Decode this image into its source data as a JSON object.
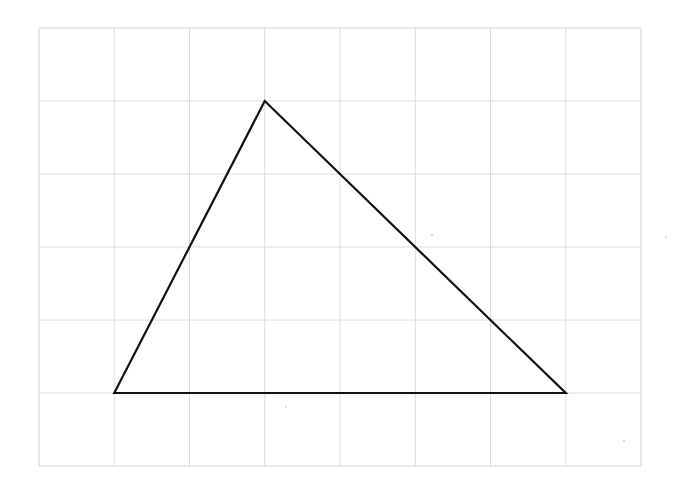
{
  "diagram": {
    "type": "triangle-on-grid",
    "grid": {
      "columns": 8,
      "rows": 6,
      "origin_px": [
        39,
        28
      ],
      "cell_w": 75.25,
      "cell_h": 73,
      "line_color": "#dcdcdc",
      "border_color": "#d4d4d4"
    },
    "triangle": {
      "vertices_grid": [
        [
          1,
          5
        ],
        [
          3,
          1
        ],
        [
          7,
          5
        ]
      ],
      "stroke_color": "#111111",
      "stroke_width": 2.2,
      "fill": "none"
    }
  }
}
